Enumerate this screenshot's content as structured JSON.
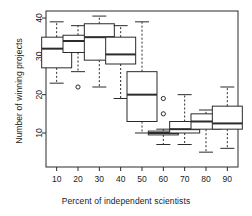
{
  "chart_data": {
    "type": "box",
    "title": "",
    "xlabel": "Percent of independent scientists",
    "ylabel": "Number of winning projects",
    "categories": [
      "10",
      "20",
      "30",
      "40",
      "50",
      "60",
      "70",
      "80",
      "90"
    ],
    "xtick_labels": [
      "10",
      "20",
      "30",
      "40",
      "50",
      "60",
      "70",
      "80",
      "90"
    ],
    "ytick_labels": [
      "10",
      "20",
      "30",
      "40"
    ],
    "ytick_values": [
      10,
      20,
      30,
      40
    ],
    "ylim": [
      4,
      41
    ],
    "grid": false,
    "legend": "none",
    "boxes": [
      {
        "category": "10",
        "whisker_low": 23,
        "q1": 27,
        "median": 32,
        "q3": 35,
        "whisker_high": 39,
        "outliers": []
      },
      {
        "category": "20",
        "whisker_low": 26,
        "q1": 31,
        "median": 34,
        "q3": 35.5,
        "whisker_high": 38,
        "outliers": [
          22
        ]
      },
      {
        "category": "30",
        "whisker_low": 22,
        "q1": 29,
        "median": 35,
        "q3": 38.5,
        "whisker_high": 40.5,
        "outliers": []
      },
      {
        "category": "40",
        "whisker_low": 19,
        "q1": 28,
        "median": 30.5,
        "q3": 35,
        "whisker_high": 38,
        "outliers": []
      },
      {
        "category": "50",
        "whisker_low": 10,
        "q1": 13,
        "median": 20,
        "q3": 26,
        "whisker_high": 39,
        "outliers": []
      },
      {
        "category": "60",
        "whisker_low": 7,
        "q1": 9.5,
        "median": 10,
        "q3": 10.5,
        "whisker_high": 11,
        "outliers": [
          19,
          15
        ]
      },
      {
        "category": "70",
        "whisker_low": 7,
        "q1": 10,
        "median": 11,
        "q3": 13,
        "whisker_high": 20,
        "outliers": []
      },
      {
        "category": "80",
        "whisker_low": 5,
        "q1": 11,
        "median": 13,
        "q3": 15,
        "whisker_high": 16,
        "outliers": []
      },
      {
        "category": "90",
        "whisker_low": 6,
        "q1": 11,
        "median": 12.5,
        "q3": 17,
        "whisker_high": 22,
        "outliers": []
      }
    ],
    "colors": {
      "line": "#2b2b2b",
      "background": "#ffffff",
      "text": "#1b1b1b"
    }
  }
}
